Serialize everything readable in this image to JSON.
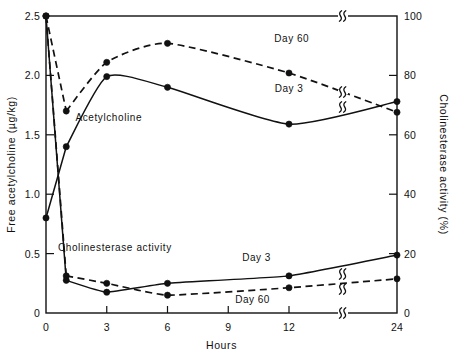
{
  "chart_data": {
    "type": "line",
    "title": "",
    "xlabel": "Hours",
    "ylabel": "Free acetylcholine  (µg/kg)",
    "y2label": "Cholinesterase  activity  (%)",
    "x": [
      0,
      1,
      3,
      6,
      12,
      24
    ],
    "xticks": [
      "0",
      "3",
      "6",
      "9",
      "12",
      "24"
    ],
    "xtick_values": [
      0,
      3,
      6,
      9,
      12,
      24
    ],
    "xlim": [
      0,
      24
    ],
    "x_axis_break": true,
    "x_axis_break_between": [
      12,
      24
    ],
    "yticks": [
      "0",
      "0.5",
      "1.0",
      "1.5",
      "2.0",
      "2.5"
    ],
    "ytick_values": [
      0,
      0.5,
      1.0,
      1.5,
      2.0,
      2.5
    ],
    "ylim": [
      0,
      2.5
    ],
    "y2ticks": [
      "0",
      "20",
      "40",
      "60",
      "80",
      "100"
    ],
    "y2tick_values": [
      0,
      20,
      40,
      60,
      80,
      100
    ],
    "y2lim": [
      0,
      100
    ],
    "grid": false,
    "legend_position": "inline-annotations",
    "group_annotations": [
      {
        "text": "Acetylcholine",
        "x": 3.1,
        "y": 1.62,
        "axis": "left"
      },
      {
        "text": "Cholinesterase  activity",
        "x": 3.4,
        "y": 0.52,
        "axis": "left"
      }
    ],
    "series": [
      {
        "name": "Acetylcholine Day 3",
        "label": "Day 3",
        "axis": "left",
        "style": "solid",
        "marker": "filled-circle",
        "x": [
          0,
          1,
          3,
          6,
          12,
          24
        ],
        "values": [
          0.8,
          1.4,
          1.99,
          1.9,
          1.59,
          1.78
        ],
        "label_x": 12.0,
        "label_y": 1.86
      },
      {
        "name": "Acetylcholine Day 60",
        "label": "Day 60",
        "axis": "left",
        "style": "dashed",
        "marker": "filled-circle",
        "x": [
          0,
          1,
          3,
          6,
          12,
          24
        ],
        "values": [
          2.5,
          1.7,
          2.11,
          2.27,
          2.02,
          1.69
        ],
        "label_x": 12.3,
        "label_y": 2.28
      },
      {
        "name": "Cholinesterase Day 3",
        "label": "Day 3",
        "axis": "right",
        "style": "solid",
        "marker": "filled-circle",
        "x": [
          0,
          1,
          3,
          6,
          12,
          24
        ],
        "values": [
          100,
          11.0,
          7.0,
          10.0,
          12.5,
          19.5
        ],
        "label_x": 10.4,
        "label_y": 17.5
      },
      {
        "name": "Cholinesterase Day 60",
        "label": "Day 60",
        "axis": "right",
        "style": "dashed",
        "marker": "filled-circle",
        "x": [
          0,
          1,
          3,
          6,
          12,
          24
        ],
        "values": [
          100,
          12.5,
          10.0,
          6.0,
          8.5,
          11.5
        ],
        "label_x": 10.2,
        "label_y": 3.2
      }
    ],
    "break_symbols": [
      {
        "series": "Acetylcholine Day 60",
        "x": 18.0
      },
      {
        "series": "Acetylcholine Day 3",
        "x": 18.0
      },
      {
        "series": "Cholinesterase Day 3",
        "x": 18.0
      },
      {
        "series": "Cholinesterase Day 60",
        "x": 18.0
      },
      {
        "series": "top-frame",
        "x": 18.0
      },
      {
        "series": "bottom-frame",
        "x": 18.0
      }
    ]
  }
}
